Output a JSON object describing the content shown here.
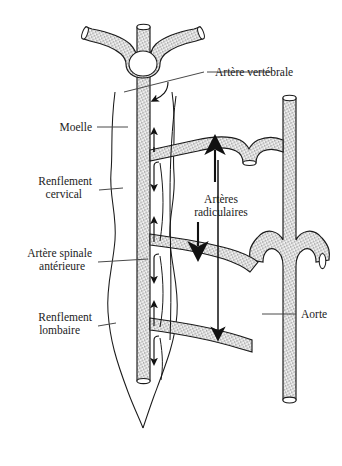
{
  "figure": {
    "language": "fr",
    "background_color": "#ffffff",
    "ink_color": "#1b1b1b",
    "vessel_fill": "stipple-pattern",
    "labels": {
      "vertebral_artery": "Artère vertébrale",
      "spinal_cord": "Moelle",
      "cervical_enlargement_line1": "Renflement",
      "cervical_enlargement_line2": "cervical",
      "anterior_spinal_artery_line1": "Artère spinale",
      "anterior_spinal_artery_line2": "antérieure",
      "lumbar_enlargement_line1": "Renflement",
      "lumbar_enlargement_line2": "lombaire",
      "radicular_arteries_line1": "Artères",
      "radicular_arteries_line2": "radiculaires",
      "aorta": "Aorte"
    },
    "structures": [
      {
        "name": "vertebral-artery",
        "label": "Artère vertébrale",
        "side": "top"
      },
      {
        "name": "spinal-cord",
        "label": "Moelle",
        "side": "left"
      },
      {
        "name": "cervical-enlargement",
        "label": "Renflement cervical",
        "side": "left"
      },
      {
        "name": "anterior-spinal-artery",
        "label": "Artère spinale antérieure",
        "side": "left"
      },
      {
        "name": "lumbar-enlargement",
        "label": "Renflement lombaire",
        "side": "left"
      },
      {
        "name": "radicular-arteries",
        "label": "Artères radiculaires",
        "side": "center"
      },
      {
        "name": "aorta",
        "label": "Aorte",
        "side": "right"
      }
    ],
    "flow_arrows": {
      "large_up_count": 1,
      "large_down_count": 2,
      "small_flow_count": 9,
      "description": "sens de circulation du sang"
    }
  }
}
